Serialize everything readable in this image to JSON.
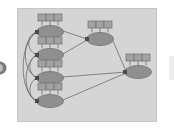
{
  "figure": {
    "type": "network-graph-diagram",
    "title": "",
    "background_color": "#ffffff",
    "panel": {
      "fill": "#d5d5d5",
      "stroke": "#c4c4c4",
      "x": 17,
      "y": 8,
      "width": 140,
      "height": 114
    },
    "node_style": {
      "ellipse_fill": "#8f8f8f",
      "ellipse_stroke": "#6e6e6e",
      "box_fill": "#a2a2a2",
      "box_stroke": "#707070",
      "stem_stroke": "#707070",
      "boxes_per_node": 3,
      "ellipse_rx": 14,
      "ellipse_ry": 6.5,
      "box_width": 8,
      "box_height": 7
    },
    "edge_style": {
      "stroke": "#5e5e5e",
      "width": 0.7
    },
    "port_style": {
      "fill": "#4a4a4a",
      "size": 3
    },
    "nodes": [
      {
        "id": "n1",
        "label": "",
        "column": "left",
        "cx": 50,
        "cy": 32
      },
      {
        "id": "n2",
        "label": "",
        "column": "left",
        "cx": 50,
        "cy": 55
      },
      {
        "id": "n3",
        "label": "",
        "column": "left",
        "cx": 50,
        "cy": 78
      },
      {
        "id": "n4",
        "label": "",
        "column": "left",
        "cx": 50,
        "cy": 101
      },
      {
        "id": "n5",
        "label": "",
        "column": "middle",
        "cx": 100,
        "cy": 39
      },
      {
        "id": "n6",
        "label": "",
        "column": "right",
        "cx": 138,
        "cy": 72
      }
    ],
    "edges": [
      {
        "from": "n1",
        "to": "n2",
        "kind": "curved-left"
      },
      {
        "from": "n1",
        "to": "n3",
        "kind": "curved-left"
      },
      {
        "from": "n1",
        "to": "n4",
        "kind": "curved-left"
      },
      {
        "from": "n2",
        "to": "n3",
        "kind": "curved-left"
      },
      {
        "from": "n2",
        "to": "n4",
        "kind": "curved-left"
      },
      {
        "from": "n3",
        "to": "n4",
        "kind": "curved-left"
      },
      {
        "from": "n1",
        "to": "n5",
        "kind": "straight"
      },
      {
        "from": "n2",
        "to": "n5",
        "kind": "straight"
      },
      {
        "from": "n5",
        "to": "n6",
        "kind": "straight"
      },
      {
        "from": "n3",
        "to": "n6",
        "kind": "straight"
      },
      {
        "from": "n4",
        "to": "n6",
        "kind": "straight"
      }
    ],
    "edge_markers": {
      "left_edge_circle": {
        "fill": "#6e6e6e",
        "cx": 0,
        "cy": 68,
        "r": 6
      },
      "right_edge_sliver": {
        "fill": "#e3e3e3",
        "x": 168,
        "y": 56,
        "width": 6,
        "height": 24
      }
    }
  }
}
